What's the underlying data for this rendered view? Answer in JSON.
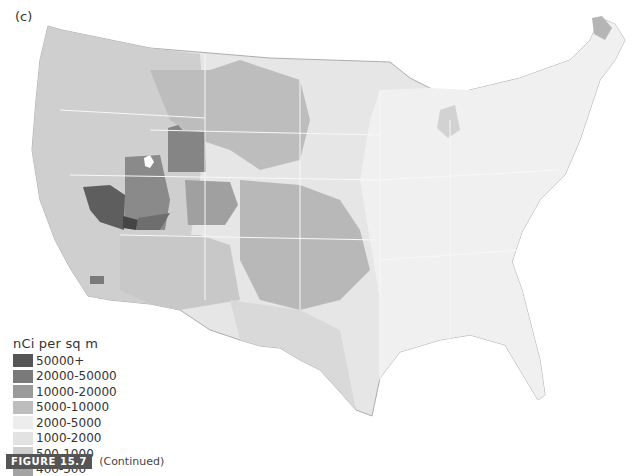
{
  "panel_label": "(c)",
  "legend": {
    "title": "nCi per sq m",
    "items": [
      {
        "label": "50000+",
        "color": "#555555"
      },
      {
        "label": "20000-50000",
        "color": "#7a7a7a"
      },
      {
        "label": "10000-20000",
        "color": "#9a9a9a"
      },
      {
        "label": "5000-10000",
        "color": "#bdbdbd"
      },
      {
        "label": "2000-5000",
        "color": "#ededed"
      },
      {
        "label": "1000-2000",
        "color": "#e2e2e2"
      },
      {
        "label": "500-1000",
        "color": "#cfcfcf"
      },
      {
        "label": "400-500",
        "color": "#a3a3a3"
      }
    ]
  },
  "caption": {
    "figure_label": "FIGURE 15.7",
    "text": "(Continued)"
  },
  "map": {
    "subject": "Contiguous United States fallout deposition",
    "hotspot_region": "Nevada / Utah",
    "colors": {
      "background": "#ffffff",
      "border": "#f6f6f6",
      "coast_outline": "#8a8a8a"
    }
  }
}
